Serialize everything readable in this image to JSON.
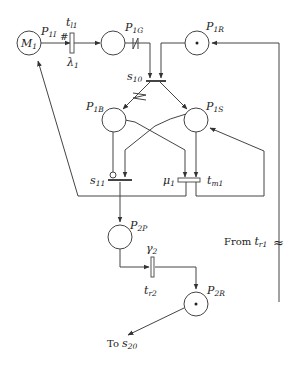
{
  "diagram": {
    "type": "petri-net",
    "places": [
      {
        "id": "M1",
        "label": "M",
        "sub": "1",
        "x": 29,
        "y": 43,
        "tokens": 0,
        "label_inside": true
      },
      {
        "id": "P1G",
        "label": "P",
        "sub": "1G",
        "x": 113,
        "y": 43,
        "tokens": 0
      },
      {
        "id": "P1R",
        "label": "P",
        "sub": "1R",
        "x": 197,
        "y": 43,
        "tokens": 1
      },
      {
        "id": "P1B",
        "label": "P",
        "sub": "1B",
        "x": 114,
        "y": 120,
        "tokens": 0
      },
      {
        "id": "P1S",
        "label": "P",
        "sub": "1S",
        "x": 196,
        "y": 120,
        "tokens": 0
      },
      {
        "id": "P2P",
        "label": "P",
        "sub": "2P",
        "x": 120,
        "y": 237,
        "tokens": 0
      },
      {
        "id": "P2R",
        "label": "P",
        "sub": "2R",
        "x": 196,
        "y": 304,
        "tokens": 1
      }
    ],
    "transitions": [
      {
        "id": "tl1",
        "label": "t",
        "sub": "l1",
        "rate_label": "λ",
        "rate_sub": "1",
        "marker": "#"
      },
      {
        "id": "s10",
        "label": "s",
        "sub": "10"
      },
      {
        "id": "s11",
        "label": "s",
        "sub": "11",
        "inhibitor": true
      },
      {
        "id": "tm1",
        "label": "t",
        "sub": "m1",
        "rate_label": "μ",
        "rate_sub": "1"
      },
      {
        "id": "tr2",
        "label": "t",
        "sub": "r2",
        "rate_label": "γ",
        "rate_sub": "2"
      }
    ],
    "labels": {
      "M1": {
        "main": "M",
        "sub": "1"
      },
      "P1I": {
        "main": "P",
        "sub": "1I"
      },
      "tl1": {
        "main": "t",
        "sub": "l1"
      },
      "lambda1": {
        "main": "λ",
        "sub": "1"
      },
      "hash": "#",
      "P1G": {
        "main": "P",
        "sub": "1G"
      },
      "P1R": {
        "main": "P",
        "sub": "1R"
      },
      "s10": {
        "main": "s",
        "sub": "10"
      },
      "P1B": {
        "main": "P",
        "sub": "1B"
      },
      "P1S": {
        "main": "P",
        "sub": "1S"
      },
      "s11": {
        "main": "s",
        "sub": "11"
      },
      "mu1": {
        "main": "μ",
        "sub": "1"
      },
      "tm1": {
        "main": "t",
        "sub": "m1"
      },
      "P2P": {
        "main": "P",
        "sub": "2P"
      },
      "gamma2": {
        "main": "γ",
        "sub": "2"
      },
      "tr2": {
        "main": "t",
        "sub": "r2"
      },
      "P2R": {
        "main": "P",
        "sub": "2R"
      },
      "from_tr1": {
        "prefix": "From ",
        "main": "t",
        "sub": "r1"
      },
      "to_s20": {
        "prefix": "To ",
        "main": "s",
        "sub": "20"
      },
      "break_symbol": "≈"
    },
    "colors": {
      "stroke": "#444444",
      "text": "#222222",
      "background": "#ffffff"
    }
  }
}
